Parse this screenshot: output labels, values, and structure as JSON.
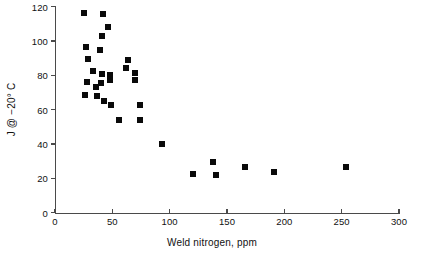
{
  "chart_data": {
    "type": "scatter",
    "title": "",
    "xlabel": "Weld nitrogen, ppm",
    "ylabel": "J @ −20° C",
    "xlim": [
      0,
      300
    ],
    "ylim": [
      0,
      120
    ],
    "xticks": [
      0,
      50,
      100,
      150,
      200,
      250,
      300
    ],
    "yticks": [
      0,
      20,
      40,
      60,
      80,
      100,
      120
    ],
    "xticklabels": [
      "0",
      "50",
      "100",
      "150",
      "200",
      "250",
      "300"
    ],
    "yticklabels": [
      "0",
      "20",
      "40",
      "60",
      "80",
      "100",
      "120"
    ],
    "grid": false,
    "legend": false,
    "marker": "square",
    "marker_color": "#0a0a0a",
    "marker_size": 6,
    "series": [
      {
        "name": "Weld impact toughness",
        "points": [
          [
            25,
            116.5
          ],
          [
            42,
            116.0
          ],
          [
            46,
            108.0
          ],
          [
            41,
            103.0
          ],
          [
            27,
            96.5
          ],
          [
            39,
            94.5
          ],
          [
            29,
            89.5
          ],
          [
            64,
            89.0
          ],
          [
            62,
            84.5
          ],
          [
            33,
            82.5
          ],
          [
            70,
            81.5
          ],
          [
            41,
            80.5
          ],
          [
            48,
            80.0
          ],
          [
            48,
            77.0
          ],
          [
            70,
            77.0
          ],
          [
            28,
            76.0
          ],
          [
            40,
            75.5
          ],
          [
            36,
            73.0
          ],
          [
            26,
            68.5
          ],
          [
            37,
            68.0
          ],
          [
            43,
            65.0
          ],
          [
            49,
            63.0
          ],
          [
            74,
            62.5
          ],
          [
            56,
            54.0
          ],
          [
            74,
            54.0
          ],
          [
            93,
            40.0
          ],
          [
            120,
            22.5
          ],
          [
            138,
            29.5
          ],
          [
            140,
            22.0
          ],
          [
            166,
            26.5
          ],
          [
            191,
            23.5
          ],
          [
            254,
            26.5
          ]
        ]
      }
    ]
  }
}
